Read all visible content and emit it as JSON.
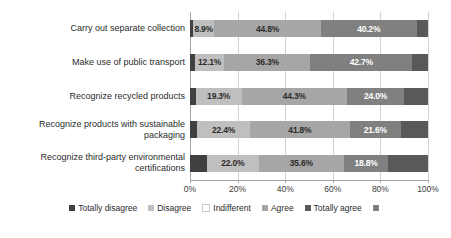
{
  "chart_data": {
    "type": "bar",
    "subtype": "stacked-horizontal-100",
    "title": "",
    "xlabel": "",
    "ylabel": "",
    "xlim": [
      0,
      100
    ],
    "grid": true,
    "legend_position": "bottom",
    "categories": [
      "Carry out separate collection",
      "Make use of public transport",
      "Recognize recycled products",
      "Recognize products with sustainable packaging",
      "Recognize third-party environmental certifications"
    ],
    "tick_labels": [
      "0%",
      "20%",
      "40%",
      "60%",
      "80%",
      "100%"
    ],
    "tick_values": [
      0,
      20,
      40,
      60,
      80,
      100
    ],
    "series": [
      {
        "name": "Totally disagree",
        "color": "#404040",
        "values": [
          1.3,
          2.2,
          2.4,
          2.9,
          7.0
        ],
        "labels": [
          "",
          "",
          "",
          "",
          ""
        ]
      },
      {
        "name": "Disagree",
        "color": "#bfbfbf",
        "values": [
          8.9,
          12.1,
          19.3,
          22.4,
          22.0
        ],
        "labels": [
          "8.9%",
          "12.1%",
          "19.3%",
          "22.4%",
          "22.0%"
        ]
      },
      {
        "name": "Indifferent",
        "color": "#a6a6a6",
        "values": [
          44.8,
          36.3,
          44.3,
          41.8,
          35.6
        ],
        "labels": [
          "44.8%",
          "36.3%",
          "44.3%",
          "41.8%",
          "35.6%"
        ]
      },
      {
        "name": "Agree",
        "color": "#808080",
        "values": [
          40.2,
          42.7,
          24.0,
          21.6,
          18.8
        ],
        "labels": [
          "40.2%",
          "42.7%",
          "24.0%",
          "21.6%",
          "18.8%"
        ]
      },
      {
        "name": "Totally agree",
        "color": "#595959",
        "values": [
          4.8,
          6.7,
          10.0,
          11.3,
          16.6
        ],
        "labels": [
          "",
          "",
          "",
          "",
          ""
        ]
      }
    ],
    "legend_entries": [
      {
        "label": "Totally disagree",
        "color": "#404040"
      },
      {
        "label": "Disagree",
        "color": "#bfbfbf"
      },
      {
        "label": "Indifferent",
        "color": "#ffffff"
      },
      {
        "label": "Agree",
        "color": "#a6a6a6"
      },
      {
        "label": "Totally agree",
        "color": "#595959"
      },
      {
        "label": "",
        "color": "#808080"
      }
    ]
  }
}
